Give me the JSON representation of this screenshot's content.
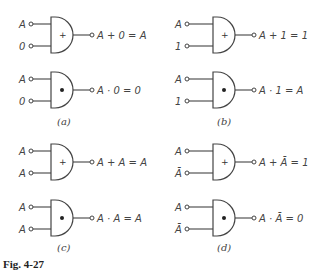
{
  "figure_label": "Fig. 4-27",
  "panels": [
    {
      "caption": "(a)",
      "gates": [
        {
          "type": "OR",
          "symbol": "+",
          "inputs": [
            "A",
            "0"
          ],
          "output": "A + 0 = A"
        },
        {
          "type": "AND",
          "symbol": "•",
          "inputs": [
            "A",
            "0"
          ],
          "output": "A · 0 = 0"
        }
      ]
    },
    {
      "caption": "(b)",
      "gates": [
        {
          "type": "OR",
          "symbol": "+",
          "inputs": [
            "A",
            "1"
          ],
          "output": "A + 1 = 1"
        },
        {
          "type": "AND",
          "symbol": "•",
          "inputs": [
            "A",
            "1"
          ],
          "output": "A · 1 = A"
        }
      ]
    },
    {
      "caption": "(c)",
      "gates": [
        {
          "type": "OR",
          "symbol": "+",
          "inputs": [
            "A",
            "A"
          ],
          "output": "A + A = A"
        },
        {
          "type": "AND",
          "symbol": "•",
          "inputs": [
            "A",
            "A"
          ],
          "output": "A · A = A"
        }
      ]
    },
    {
      "caption": "(d)",
      "gates": [
        {
          "type": "OR",
          "symbol": "+",
          "inputs": [
            "A",
            "Ā"
          ],
          "output": "A + Ā = 1"
        },
        {
          "type": "AND",
          "symbol": "•",
          "inputs": [
            "A",
            "Ā"
          ],
          "output": "A · Ā = 0"
        }
      ]
    }
  ]
}
